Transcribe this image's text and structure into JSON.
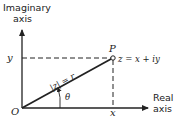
{
  "diagram": {
    "imaginary_axis_label_line1": "Imaginary",
    "imaginary_axis_label_line2": "axis",
    "real_axis_label_line1": "Real",
    "real_axis_label_line2": "axis",
    "origin_label": "O",
    "point_label": "P",
    "point_equation": "z = x + iy",
    "modulus_label": "|z| = r",
    "angle_label": "θ",
    "x_tick_label": "x",
    "y_tick_label": "y",
    "colors": {
      "line": "#222222",
      "background": "#ffffff"
    }
  }
}
